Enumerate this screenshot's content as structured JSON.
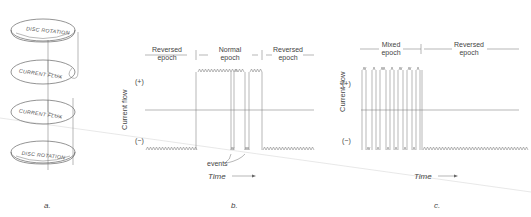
{
  "figure": {
    "panels": [
      {
        "id": "a",
        "label": "a.",
        "discs": [
          {
            "text": "DISC ROTATION"
          },
          {
            "text": "CURRENT FLUX"
          },
          {
            "text": "CURRENT FLUX"
          },
          {
            "text": "DISC ROTATION"
          }
        ]
      },
      {
        "id": "b",
        "label": "b.",
        "ylabel": "Current flow",
        "plus": "(+)",
        "minus": "(−)",
        "epochs": [
          {
            "line1": "Reversed",
            "line2": "epoch"
          },
          {
            "line1": "Normal",
            "line2": "epoch"
          },
          {
            "line1": "Reversed",
            "line2": "epoch"
          }
        ],
        "events_label": "events",
        "xlabel": "Time"
      },
      {
        "id": "c",
        "label": "c.",
        "ylabel": "Current flow",
        "plus": "(+)",
        "minus": "(−)",
        "epochs": [
          {
            "line1": "Mixed",
            "line2": "epoch"
          },
          {
            "line1": "Reversed",
            "line2": "epoch"
          }
        ],
        "xlabel": "Time"
      }
    ],
    "colors": {
      "ink": "#555555",
      "background": "#ffffff"
    }
  }
}
